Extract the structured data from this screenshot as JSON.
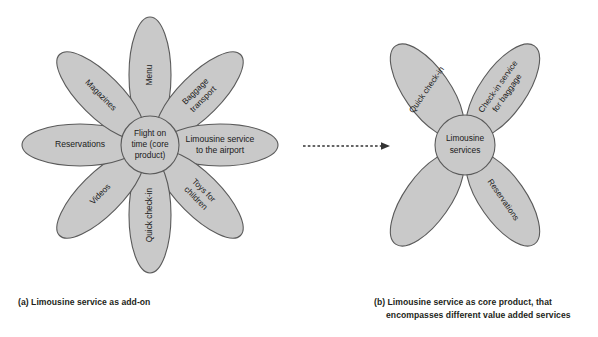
{
  "figure": {
    "background": "#ffffff",
    "petal_fill": "#c9c9c9",
    "petal_stroke": "#5a5a5a",
    "text_color": "#1a1a1a"
  },
  "diagram_a": {
    "name": "limousine-service-as-add-on",
    "core": {
      "line1": "Flight on",
      "line2": "time (core",
      "line3": "product)"
    },
    "petals": [
      {
        "id": "menu",
        "label": "Menu",
        "lines": [
          "Menu"
        ],
        "angle_deg": 90
      },
      {
        "id": "baggage",
        "label": "Baggage transport",
        "lines": [
          "Baggage",
          "transport"
        ],
        "angle_deg": 45
      },
      {
        "id": "limousine",
        "label": "Limousine service to the airport",
        "lines": [
          "Limousine service",
          "to the airport"
        ],
        "angle_deg": 0
      },
      {
        "id": "toys",
        "label": "Toys for children",
        "lines": [
          "Toys for",
          "children"
        ],
        "angle_deg": -45
      },
      {
        "id": "quickcheckin",
        "label": "Quick check-in",
        "lines": [
          "Quick check-in"
        ],
        "angle_deg": -90
      },
      {
        "id": "videos",
        "label": "Videos",
        "lines": [
          "Videos"
        ],
        "angle_deg": -135
      },
      {
        "id": "reservations",
        "label": "Reservations",
        "lines": [
          "Reservations"
        ],
        "angle_deg": 180
      },
      {
        "id": "magazines",
        "label": "Magazines",
        "lines": [
          "Magazines"
        ],
        "angle_deg": 135
      }
    ],
    "caption": "(a) Limousine service as add-on"
  },
  "diagram_b": {
    "name": "limousine-service-as-core-product",
    "core": {
      "line1": "Limousine",
      "line2": "services"
    },
    "petals": [
      {
        "id": "food",
        "label": "Food & beverages",
        "lines": [
          "Food &",
          "beverages"
        ],
        "angle_deg": 125
      },
      {
        "id": "checkin-bag",
        "label": "Check-in service for baggage",
        "lines": [
          "Check-in service",
          "for baggage"
        ],
        "angle_deg": 55
      },
      {
        "id": "reservations",
        "label": "Reservations",
        "lines": [
          "Reservations"
        ],
        "angle_deg": -55
      },
      {
        "id": "quickcheckin",
        "label": "Quick check-in",
        "lines": [
          "Quick check-in"
        ],
        "angle_deg": -125
      }
    ],
    "caption_line1": "(b) Limousine service as core product, that",
    "caption_line2": "encompasses different value added services"
  },
  "connector": {
    "id": "transition-arrow",
    "style": "dashed-arrow",
    "direction": "left-to-right"
  }
}
